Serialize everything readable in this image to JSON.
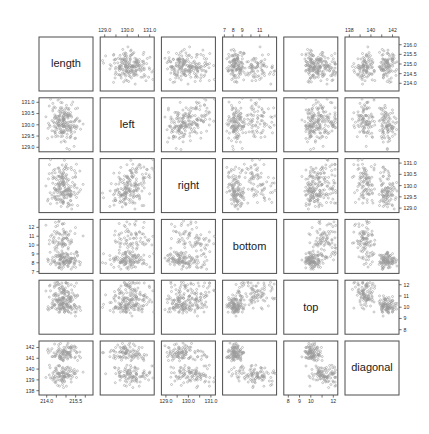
{
  "figure": {
    "type": "scatterplot-matrix",
    "title": "",
    "background": "#ffffff",
    "frame_color": "#4d4d4d",
    "point_color": "#9a9a9a",
    "n_variables": 6,
    "n_points": 200
  },
  "variables": [
    {
      "key": "length",
      "label": "length",
      "range": [
        213.6,
        216.4
      ],
      "ticks": [
        214.0,
        214.5,
        215.0,
        215.5,
        216.0
      ],
      "major_ticks": [
        214.0,
        215.5
      ]
    },
    {
      "key": "left",
      "label": "left",
      "range": [
        128.8,
        131.2
      ],
      "ticks": [
        129.0,
        129.5,
        130.0,
        130.5,
        131.0
      ],
      "major_ticks": [
        129.0,
        130.0,
        131.0
      ]
    },
    {
      "key": "right",
      "label": "right",
      "range": [
        128.8,
        131.2
      ],
      "ticks": [
        129.0,
        129.5,
        130.0,
        130.5,
        131.0
      ],
      "major_ticks": [
        129.0,
        130.0,
        131.0
      ]
    },
    {
      "key": "bottom",
      "label": "bottom",
      "range": [
        6.8,
        12.9
      ],
      "ticks": [
        7,
        8,
        9,
        10,
        11,
        12
      ],
      "major_ticks": [
        7,
        8,
        9,
        11
      ]
    },
    {
      "key": "top",
      "label": "top",
      "range": [
        7.6,
        12.4
      ],
      "ticks": [
        8,
        9,
        10,
        11,
        12
      ],
      "major_ticks": [
        8,
        9,
        10,
        12
      ]
    },
    {
      "key": "diagonal",
      "label": "diagonal",
      "range": [
        137.6,
        142.6
      ],
      "ticks": [
        138,
        139,
        140,
        141,
        142
      ],
      "major_ticks": [
        138,
        140,
        142
      ]
    }
  ],
  "axes": {
    "top": [
      {
        "column": 2,
        "variable": "left",
        "labels": [
          "129.0",
          "130.0",
          "131.0"
        ],
        "values": [
          129.0,
          130.0,
          131.0
        ]
      },
      {
        "column": 4,
        "variable": "bottom",
        "labels": [
          "7",
          "8",
          "9",
          "11"
        ],
        "values": [
          7,
          8,
          9,
          11
        ]
      },
      {
        "column": 6,
        "variable": "diagonal",
        "labels": [
          "138",
          "140",
          "142"
        ],
        "values": [
          138,
          140,
          142
        ]
      }
    ],
    "bottom": [
      {
        "column": 1,
        "variable": "length",
        "labels": [
          "214.0",
          "215.5"
        ],
        "values": [
          214.0,
          215.5
        ]
      },
      {
        "column": 3,
        "variable": "right",
        "labels": [
          "129.0",
          "130.0",
          "131.0"
        ],
        "values": [
          129.0,
          130.0,
          131.0
        ]
      },
      {
        "column": 5,
        "variable": "top",
        "labels": [
          "8",
          "9",
          "10",
          "12"
        ],
        "values": [
          8,
          9,
          10,
          12
        ]
      }
    ],
    "left": [
      {
        "row": 2,
        "variable": "left",
        "labels": [
          "131.0",
          "130.5",
          "130.0",
          "129.5",
          "129.0"
        ],
        "values": [
          131.0,
          130.5,
          130.0,
          129.5,
          129.0
        ]
      },
      {
        "row": 4,
        "variable": "bottom",
        "labels": [
          "12",
          "11",
          "10",
          "9",
          "8",
          "7"
        ],
        "values": [
          12,
          11,
          10,
          9,
          8,
          7
        ]
      },
      {
        "row": 6,
        "variable": "diagonal",
        "labels": [
          "142",
          "141",
          "140",
          "139",
          "138"
        ],
        "values": [
          142,
          141,
          140,
          139,
          138
        ]
      }
    ],
    "right": [
      {
        "row": 1,
        "variable": "length",
        "labels": [
          "216.0",
          "215.5",
          "215.0",
          "214.5",
          "214.0"
        ],
        "values": [
          216.0,
          215.5,
          215.0,
          214.5,
          214.0
        ]
      },
      {
        "row": 3,
        "variable": "right",
        "labels": [
          "131.0",
          "130.5",
          "130.0",
          "129.5",
          "129.0"
        ],
        "values": [
          131.0,
          130.5,
          130.0,
          129.5,
          129.0
        ]
      },
      {
        "row": 5,
        "variable": "top",
        "labels": [
          "12",
          "11",
          "10",
          "9",
          "8"
        ],
        "values": [
          12,
          11,
          10,
          9,
          8
        ]
      }
    ]
  },
  "chart_data": {
    "type": "scatter",
    "title": "",
    "xlabel": "",
    "ylabel": "",
    "matrix": true,
    "variables": [
      "length",
      "left",
      "right",
      "bottom",
      "top",
      "diagonal"
    ],
    "groups": [
      {
        "name": "genuine",
        "n": 100
      },
      {
        "name": "counterfeit",
        "n": 100
      }
    ],
    "group_means": {
      "genuine": {
        "length": 214.97,
        "left": 129.94,
        "right": 129.72,
        "bottom": 8.31,
        "top": 10.17,
        "diagonal": 141.52
      },
      "counterfeit": {
        "length": 214.82,
        "left": 130.3,
        "right": 130.19,
        "bottom": 10.53,
        "top": 11.13,
        "diagonal": 139.45
      }
    },
    "group_sds": {
      "genuine": {
        "length": 0.4,
        "left": 0.35,
        "right": 0.36,
        "bottom": 0.41,
        "top": 0.43,
        "diagonal": 0.4
      },
      "counterfeit": {
        "length": 0.38,
        "left": 0.36,
        "right": 0.4,
        "bottom": 1.13,
        "top": 0.64,
        "diagonal": 0.43
      }
    },
    "axis_ranges": {
      "length": [
        213.6,
        216.4
      ],
      "left": [
        128.8,
        131.2
      ],
      "right": [
        128.8,
        131.2
      ],
      "bottom": [
        6.8,
        12.9
      ],
      "top": [
        7.6,
        12.4
      ],
      "diagonal": [
        137.6,
        142.6
      ]
    },
    "grid": false,
    "legend": "none"
  }
}
